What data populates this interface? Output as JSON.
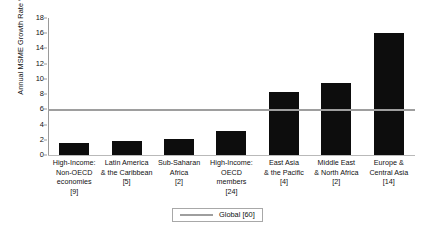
{
  "chart_data": {
    "type": "bar",
    "title": "",
    "xlabel": "",
    "ylabel": "Annual MSME Growth Rate %",
    "ylim": [
      0,
      18
    ],
    "ytick_step": 2,
    "yticks": [
      0,
      2,
      4,
      6,
      8,
      10,
      12,
      14,
      16,
      18
    ],
    "grid": false,
    "legend_position": "bottom-center",
    "categories": [
      "High-Income: Non-OECD economies [9]",
      "Latin America & the Caribbean [5]",
      "Sub-Saharan Africa [2]",
      "High-Income: OECD members [24]",
      "East Asia & the Pacific [4]",
      "Middle East & North Africa [2]",
      "Europe & Central Asia [14]"
    ],
    "category_lines": [
      [
        "High-Income:",
        "Non-OECD",
        "economies",
        "[9]"
      ],
      [
        "Latin America",
        "& the Caribbean",
        "[5]"
      ],
      [
        "Sub-Saharan",
        "Africa",
        "[2]"
      ],
      [
        "High-Income:",
        "OECD members",
        "[24]"
      ],
      [
        "East Asia",
        "& the Pacific",
        "[4]"
      ],
      [
        "Middle East",
        "& North Africa",
        "[2]"
      ],
      [
        "Europe &",
        "Central Asia",
        "[14]"
      ]
    ],
    "values": [
      1.6,
      1.9,
      2.1,
      3.2,
      8.3,
      9.5,
      16.0
    ],
    "series": [
      {
        "name": "Annual MSME Growth Rate %",
        "values": [
          1.6,
          1.9,
          2.1,
          3.2,
          8.3,
          9.5,
          16.0
        ]
      }
    ],
    "reference_lines": [
      {
        "label": "Global [60]",
        "value": 6.0,
        "color": "#9e9e9e"
      }
    ],
    "legend": [
      {
        "label": "Global [60]",
        "type": "line",
        "color": "#9e9e9e"
      }
    ],
    "bar_color": "#0d0d0d",
    "axis_color": "#9a9a9a",
    "background": "#ffffff"
  }
}
